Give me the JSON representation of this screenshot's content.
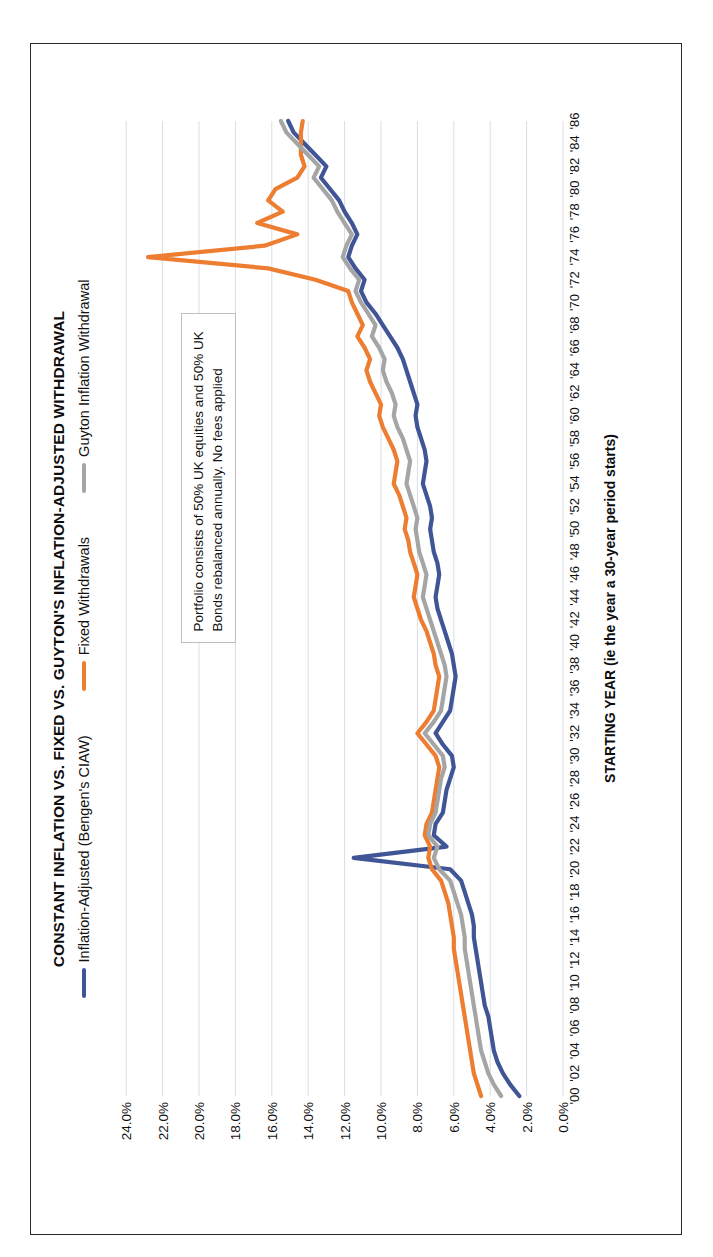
{
  "chart_data": {
    "type": "line",
    "title": "CONSTANT INFLATION VS. FIXED VS. GUYTON'S INFLATION-ADJUSTED WITHDRAWAL",
    "xlabel": "STARTING YEAR (ie the year a 30-year period starts)",
    "ylabel": "SUSTAINABLE WITHDRAWAL RATES",
    "ylim": [
      0,
      25
    ],
    "yticks": [
      "0.0%",
      "2.0%",
      "4.0%",
      "6.0%",
      "8.0%",
      "10.0%",
      "12.0%",
      "14.0%",
      "16.0%",
      "18.0%",
      "20.0%",
      "22.0%",
      "24.0%"
    ],
    "ytick_values": [
      0,
      2,
      4,
      6,
      8,
      10,
      12,
      14,
      16,
      18,
      20,
      22,
      24
    ],
    "grid": "y-gridlines-only",
    "legend_position": "top-center",
    "annotation": "Portfolio consists of 50% UK equities and 50% UK Bonds rebalanced annually. No fees applied",
    "rotation_note": "chart printed rotated 90 degrees",
    "x": [
      1900,
      1901,
      1902,
      1903,
      1904,
      1905,
      1906,
      1907,
      1908,
      1909,
      1910,
      1911,
      1912,
      1913,
      1914,
      1915,
      1916,
      1917,
      1918,
      1919,
      1920,
      1921,
      1922,
      1923,
      1924,
      1925,
      1926,
      1927,
      1928,
      1929,
      1930,
      1931,
      1932,
      1933,
      1934,
      1935,
      1936,
      1937,
      1938,
      1939,
      1940,
      1941,
      1942,
      1943,
      1944,
      1945,
      1946,
      1947,
      1948,
      1949,
      1950,
      1951,
      1952,
      1953,
      1954,
      1955,
      1956,
      1957,
      1958,
      1959,
      1960,
      1961,
      1962,
      1963,
      1964,
      1965,
      1966,
      1967,
      1968,
      1969,
      1970,
      1971,
      1972,
      1973,
      1974,
      1975,
      1976,
      1977,
      1978,
      1979,
      1980,
      1981,
      1982,
      1983,
      1984,
      1985,
      1986
    ],
    "xticks": [
      "'00",
      "'02",
      "'04",
      "'06",
      "'08",
      "'10",
      "'12",
      "'14",
      "'16",
      "'18",
      "'20",
      "'22",
      "'24",
      "'26",
      "'28",
      "'30",
      "'32",
      "'34",
      "'36",
      "'38",
      "'40",
      "'42",
      "'44",
      "'46",
      "'48",
      "'50",
      "'52",
      "'54",
      "'56",
      "'58",
      "'60",
      "'62",
      "'64",
      "'66",
      "'68",
      "'70",
      "'72",
      "'74",
      "'76",
      "'78",
      "'80",
      "'82",
      "'84",
      "'86"
    ],
    "series": [
      {
        "name": "Inflation-Adjusted (Bengen's CIAW)",
        "color": "#3F5596",
        "values": [
          2.4,
          2.9,
          3.3,
          3.6,
          3.8,
          3.9,
          4.0,
          4.1,
          4.3,
          4.4,
          4.5,
          4.6,
          4.7,
          4.8,
          4.9,
          4.9,
          5.0,
          5.2,
          5.4,
          5.6,
          6.2,
          11.5,
          6.4,
          7.1,
          7.0,
          6.6,
          6.5,
          6.4,
          6.2,
          6.0,
          6.1,
          6.6,
          7.0,
          6.6,
          6.2,
          6.1,
          6.0,
          5.9,
          6.0,
          6.1,
          6.3,
          6.5,
          6.7,
          6.9,
          7.0,
          6.9,
          6.8,
          6.9,
          7.1,
          7.2,
          7.3,
          7.2,
          7.3,
          7.5,
          7.7,
          7.6,
          7.5,
          7.6,
          7.8,
          8.0,
          8.1,
          8.0,
          8.2,
          8.4,
          8.6,
          8.8,
          9.1,
          9.5,
          9.9,
          10.3,
          10.8,
          11.1,
          10.9,
          11.4,
          11.8,
          11.6,
          11.3,
          11.6,
          12.0,
          12.3,
          12.8,
          13.3,
          13.0,
          13.6,
          14.2,
          14.8,
          15.1
        ]
      },
      {
        "name": "Fixed Withdrawals",
        "color": "#ED7D31",
        "values": [
          4.5,
          4.7,
          4.9,
          5.0,
          5.1,
          5.2,
          5.3,
          5.4,
          5.5,
          5.6,
          5.7,
          5.8,
          5.9,
          6.0,
          6.0,
          6.1,
          6.2,
          6.3,
          6.5,
          6.7,
          7.2,
          7.4,
          7.3,
          7.6,
          7.5,
          7.2,
          7.1,
          7.0,
          6.9,
          6.8,
          7.0,
          7.5,
          8.0,
          7.5,
          7.1,
          7.0,
          6.9,
          6.8,
          7.0,
          7.1,
          7.3,
          7.5,
          7.8,
          8.0,
          8.2,
          8.1,
          8.0,
          8.2,
          8.4,
          8.5,
          8.7,
          8.6,
          8.8,
          9.0,
          9.3,
          9.2,
          9.1,
          9.3,
          9.6,
          9.9,
          10.1,
          10.0,
          10.3,
          10.6,
          10.8,
          10.6,
          10.9,
          11.3,
          11.0,
          11.3,
          11.6,
          11.8,
          13.6,
          16.2,
          22.8,
          16.4,
          14.6,
          16.8,
          15.4,
          16.2,
          15.8,
          14.6,
          14.2,
          14.4,
          14.4,
          14.4,
          14.3
        ]
      },
      {
        "name": "Guyton Inflation Withdrawal",
        "color": "#A5A5A5",
        "values": [
          3.4,
          3.8,
          4.1,
          4.3,
          4.5,
          4.6,
          4.7,
          4.8,
          4.9,
          5.0,
          5.1,
          5.2,
          5.3,
          5.4,
          5.4,
          5.5,
          5.6,
          5.8,
          6.0,
          6.2,
          6.8,
          7.1,
          6.9,
          7.4,
          7.3,
          7.0,
          6.9,
          6.8,
          6.7,
          6.5,
          6.6,
          7.1,
          7.6,
          7.1,
          6.7,
          6.6,
          6.5,
          6.4,
          6.5,
          6.7,
          6.9,
          7.1,
          7.3,
          7.5,
          7.7,
          7.6,
          7.5,
          7.7,
          7.9,
          8.0,
          8.1,
          8.0,
          8.2,
          8.4,
          8.6,
          8.5,
          8.4,
          8.6,
          8.8,
          9.1,
          9.3,
          9.2,
          9.4,
          9.7,
          9.9,
          9.8,
          10.1,
          10.5,
          10.3,
          10.7,
          11.1,
          11.4,
          11.2,
          11.7,
          12.1,
          11.9,
          11.6,
          12.0,
          12.4,
          12.7,
          13.2,
          13.7,
          13.4,
          14.0,
          14.6,
          15.2,
          15.5
        ]
      }
    ]
  }
}
